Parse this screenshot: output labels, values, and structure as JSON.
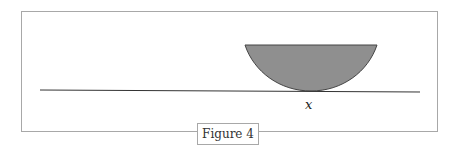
{
  "figure": {
    "caption": "Figure 4",
    "point_label": "x",
    "colors": {
      "fill": "#8f8f8f",
      "stroke": "#333333",
      "frame": "#a8a8a8"
    },
    "shapes": {
      "baseline": {
        "x1": 40,
        "y1": 90,
        "x2": 420,
        "y2": 92
      },
      "bowl": {
        "left_x": 245,
        "right_x": 377,
        "top_y": 45,
        "bottom_x": 311,
        "bottom_y": 91
      }
    }
  }
}
